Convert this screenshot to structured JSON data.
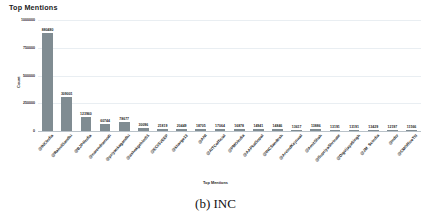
{
  "figure": {
    "caption": "(b) INC"
  },
  "chart_data": {
    "type": "bar",
    "title": "Top Mentions",
    "xlabel": "Top Mentions",
    "ylabel": "Count",
    "ylim": [
      0,
      1000000
    ],
    "yticks": [
      0,
      250000,
      500000,
      750000,
      1000000
    ],
    "ytick_labels": [
      "0",
      "250000",
      "500000",
      "750000",
      "1000000"
    ],
    "grid": true,
    "legend": "none",
    "bar_color": "#808c92",
    "categories": [
      "@INCIndia",
      "@RahulGandhi",
      "@BJP4India",
      "@narendramodi",
      "@priyankagandhi",
      "@ashokgehlot51",
      "@ECISVEEP",
      "@kharge13",
      "@ANI",
      "@AITCofficial",
      "@PMOIndia",
      "@AAPkaGopal",
      "@INCSandesh",
      "@ArvindKejriwal",
      "@AmitShah",
      "@SupriyaShrinate",
      "@DigvijayaSingh",
      "@JM_Scindia",
      "@ndtv",
      "@CMOfficeTN"
    ],
    "values": [
      880480,
      309001,
      123960,
      60744,
      78677,
      30096,
      21819,
      20449,
      18705,
      17064,
      16878,
      14941,
      14846,
      13617,
      13886,
      13191,
      13191,
      13429,
      12197,
      11566
    ],
    "value_labels": [
      "880480",
      "309001",
      "123960",
      "60744",
      "78677",
      "30096",
      "21819",
      "20449",
      "18705",
      "17064",
      "16878",
      "14941",
      "14846",
      "13617",
      "13886",
      "13191",
      "13191",
      "13429",
      "12197",
      "11566"
    ]
  }
}
